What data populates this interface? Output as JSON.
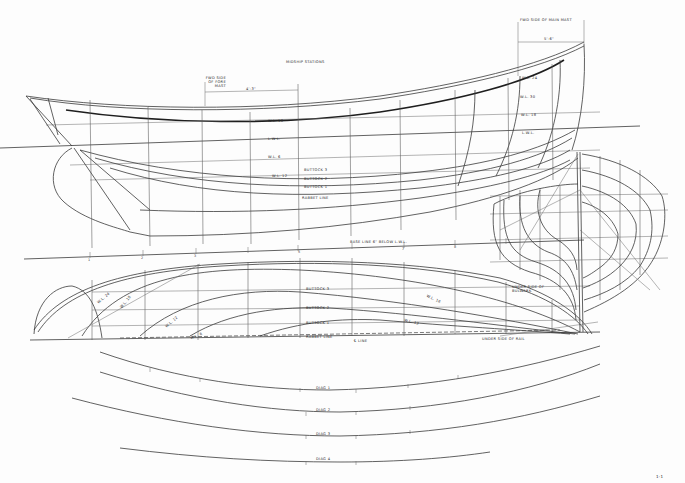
{
  "drawing": {
    "type": "lines-plan",
    "views": [
      "profile",
      "half-breadth-plan",
      "body-plan",
      "diagonals"
    ]
  },
  "profile": {
    "annotations": {
      "fwd_side_main_mast": "FWD SIDE OF MAIN MAST",
      "main_mast_dim": "5'-6\"",
      "fwd_side_fore_mast": "FWD SIDE OF FORE MAST",
      "fore_mast_dim": "4'-3\"",
      "midship_stations": "MIDSHIP STATIONS"
    },
    "waterlines": [
      "W.L. 18",
      "L.W.L.",
      "W.L. 6",
      "W.L. 12"
    ],
    "buttocks": [
      "BUTTOCK 3",
      "BUTTOCK 2",
      "BUTTOCK 1"
    ],
    "rabbet": "RABBET LINE",
    "stern_labels": [
      "W.L. 24",
      "W.L. 30",
      "W.L. 18",
      "L.W.L."
    ]
  },
  "baseline": {
    "label": "BASE LINE 6\" BELOW L.W.L.",
    "stations": [
      "0",
      "1",
      "2",
      "3",
      "4",
      "5",
      "6",
      "7",
      "8",
      "9"
    ]
  },
  "half_breadth": {
    "buttocks": [
      "BUTTOCK 3",
      "BUTTOCK 2",
      "BUTTOCK 1"
    ],
    "rabbet": "RABBET LINE",
    "centerline": "℄ LINE",
    "waterlines": [
      "W.L. 24",
      "W.L. 18",
      "W.L. 12",
      "W.L. 6",
      "W.L. 18",
      "W.L. 12"
    ],
    "under_side_bulwark": "UNDER SIDE OF BULWARK",
    "under_side_rail": "UNDER SIDE OF RAIL"
  },
  "diagonals": {
    "labels": [
      "DIAG 1",
      "DIAG 2",
      "DIAG 3",
      "DIAG 4"
    ]
  },
  "sheet": {
    "sheet_mark": "1-1"
  }
}
